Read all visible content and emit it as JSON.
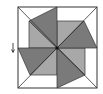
{
  "diagram": {
    "type": "pinwheel-quilt-block",
    "colors": {
      "background": "#ffffff",
      "outline": "#333333",
      "dark_blade": "#7a7a7a",
      "light_blade": "#a8a8a8",
      "center_dot": "#111111"
    },
    "square": {
      "x": 18,
      "y": 7,
      "size": 80
    },
    "center": {
      "x": 57,
      "y": 48
    },
    "marker": {
      "icon": "down-arrow-icon",
      "x": 13,
      "y": 42
    }
  }
}
